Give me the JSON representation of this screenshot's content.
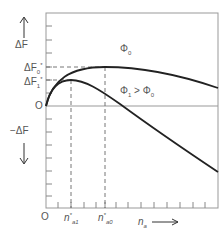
{
  "diagram": {
    "y_axis": {
      "up_label": "ΔF",
      "down_label": "−ΔF",
      "origin_label": "O",
      "ticks": [
        {
          "label": "ΔF",
          "sub": "0",
          "sup": "*"
        },
        {
          "label": "ΔF",
          "sub": "1",
          "sup": "*"
        }
      ]
    },
    "x_axis": {
      "label": "n",
      "label_sub": "a",
      "origin_label": "O",
      "ticks": [
        {
          "label": "n",
          "sub": "a1",
          "sup": "*"
        },
        {
          "label": "n",
          "sub": "a0",
          "sup": "*"
        }
      ]
    },
    "curves": [
      {
        "name": "Φ0",
        "label": "Φ",
        "label_sub": "0"
      },
      {
        "name": "Φ1 > Φ0",
        "label_a": "Φ",
        "label_a_sub": "1",
        "relation": ">",
        "label_b": "Φ",
        "label_b_sub": "0"
      }
    ],
    "colors": {
      "line": "#222222",
      "frame": "#888888",
      "dash": "#666666",
      "text": "#555555"
    }
  }
}
